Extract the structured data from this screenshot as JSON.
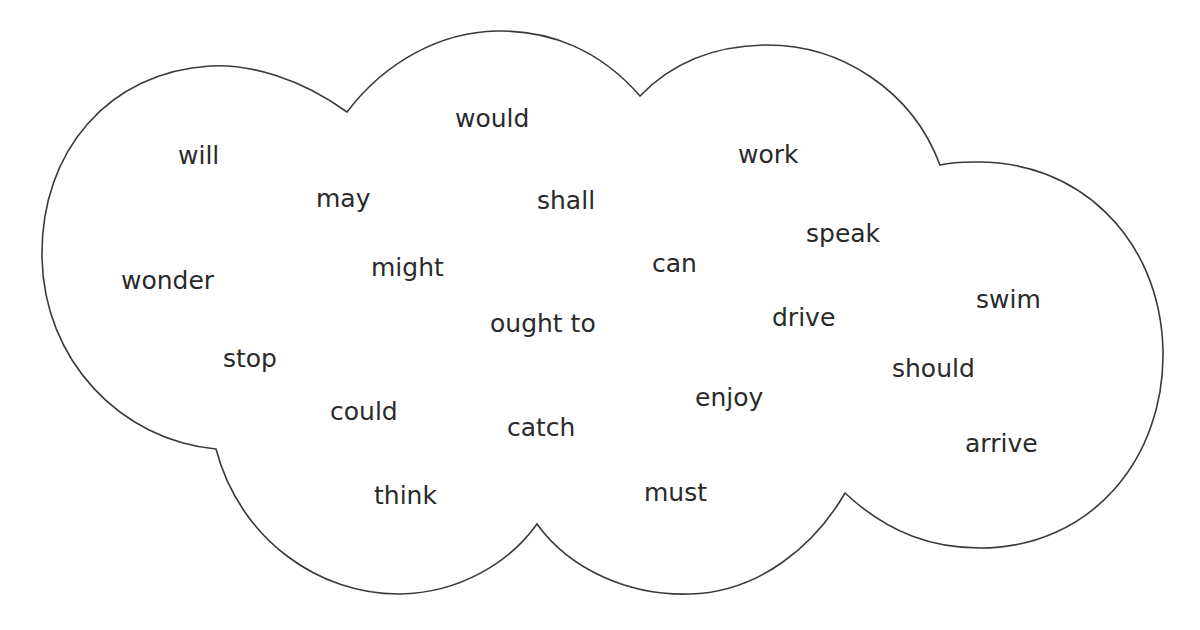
{
  "diagram": {
    "type": "word-cloud",
    "outline_color": "#3a3a3a",
    "text_color": "#2a2a2a",
    "background": "#ffffff",
    "words": [
      {
        "text": "will",
        "x": 178,
        "y": 143
      },
      {
        "text": "would",
        "x": 455,
        "y": 106
      },
      {
        "text": "work",
        "x": 738,
        "y": 142
      },
      {
        "text": "may",
        "x": 316,
        "y": 186
      },
      {
        "text": "shall",
        "x": 537,
        "y": 188
      },
      {
        "text": "speak",
        "x": 806,
        "y": 221
      },
      {
        "text": "wonder",
        "x": 121,
        "y": 268
      },
      {
        "text": "might",
        "x": 371,
        "y": 255
      },
      {
        "text": "can",
        "x": 652,
        "y": 251
      },
      {
        "text": "swim",
        "x": 976,
        "y": 287
      },
      {
        "text": "ought to",
        "x": 490,
        "y": 311
      },
      {
        "text": "drive",
        "x": 772,
        "y": 305
      },
      {
        "text": "stop",
        "x": 223,
        "y": 346
      },
      {
        "text": "should",
        "x": 892,
        "y": 356
      },
      {
        "text": "could",
        "x": 330,
        "y": 399
      },
      {
        "text": "enjoy",
        "x": 695,
        "y": 385
      },
      {
        "text": "catch",
        "x": 507,
        "y": 415
      },
      {
        "text": "arrive",
        "x": 965,
        "y": 431
      },
      {
        "text": "think",
        "x": 374,
        "y": 483
      },
      {
        "text": "must",
        "x": 644,
        "y": 480
      }
    ]
  }
}
